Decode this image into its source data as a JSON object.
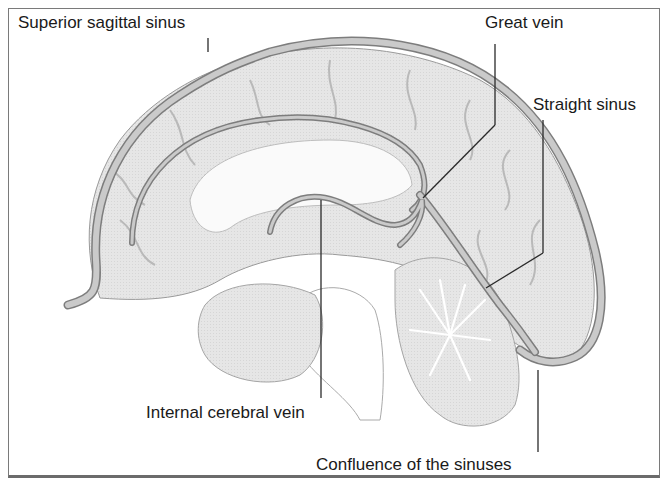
{
  "figure": {
    "labels": {
      "superior_sagittal_sinus": "Superior sagittal sinus",
      "great_vein": "Great vein",
      "straight_sinus": "Straight sinus",
      "internal_cerebral_vein": "Internal cerebral vein",
      "confluence": "Confluence of the sinuses"
    },
    "colors": {
      "brain_fill": "#e4e4e4",
      "sinus_fill": "#c9c9c9",
      "sinus_stroke": "#7d7d7d",
      "sulcus": "#b8b8b8",
      "leader_line": "#2a2a2a",
      "frame": "#7a7a7a"
    }
  }
}
